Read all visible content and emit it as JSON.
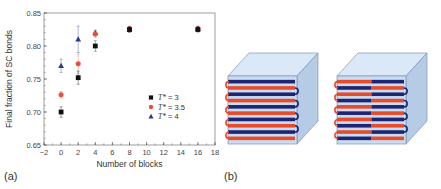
{
  "panels": {
    "a_label": "(a)",
    "b_label": "(b)"
  },
  "chart_data": {
    "type": "scatter",
    "title": "",
    "xlabel": "Number of blocks",
    "ylabel": "Final fraction of SC bonds",
    "xlim": [
      -2,
      18
    ],
    "ylim": [
      0.65,
      0.85
    ],
    "xticks": [
      -2,
      0,
      2,
      4,
      6,
      8,
      10,
      12,
      14,
      16,
      18
    ],
    "yticks": [
      0.65,
      0.7,
      0.75,
      0.8,
      0.85
    ],
    "ytick_labels": [
      "0.65",
      "0.70",
      "0.75",
      "0.80",
      "0.85"
    ],
    "legend_position": "lower right inside",
    "grid": false,
    "series": [
      {
        "name": "T* = 3",
        "legend_italic": "T*",
        "legend_value": " = 3",
        "marker": "square",
        "color": "#111111",
        "x": [
          0,
          2,
          4,
          8,
          16
        ],
        "y": [
          0.7,
          0.752,
          0.8,
          0.825,
          0.825
        ],
        "err": [
          0.008,
          0.01,
          0.008,
          0.004,
          0.004
        ]
      },
      {
        "name": "T* = 3.5",
        "legend_italic": "T*",
        "legend_value": " = 3.5",
        "marker": "circle",
        "color": "#e8503a",
        "x": [
          0,
          2,
          4,
          8,
          16
        ],
        "y": [
          0.726,
          0.773,
          0.818,
          0.826,
          0.826
        ],
        "err": [
          0.005,
          0.015,
          0.005,
          0.004,
          0.004
        ]
      },
      {
        "name": "T* = 4",
        "legend_italic": "T*",
        "legend_value": " = 4",
        "marker": "triangle",
        "color": "#2a3a8c",
        "x": [
          0,
          2,
          4,
          8,
          16
        ],
        "y": [
          0.77,
          0.81,
          0.82,
          0.825,
          0.826
        ],
        "err": [
          0.01,
          0.02,
          0.004,
          0.004,
          0.004
        ]
      }
    ]
  },
  "diagram": {
    "cube_colors": {
      "front": "#c9dcf2",
      "top": "#dbe8f8",
      "side": "#b6cbe6",
      "edge": "#7f95b5",
      "red": "#e84a2c",
      "blue": "#1e2470"
    },
    "cube1_pattern": "alternating whole strips blue/red (homopolymer blocks)",
    "cube2_pattern": "strips split in half, alternating red|blue and blue|red (multiblock)",
    "strip_count": 10
  }
}
